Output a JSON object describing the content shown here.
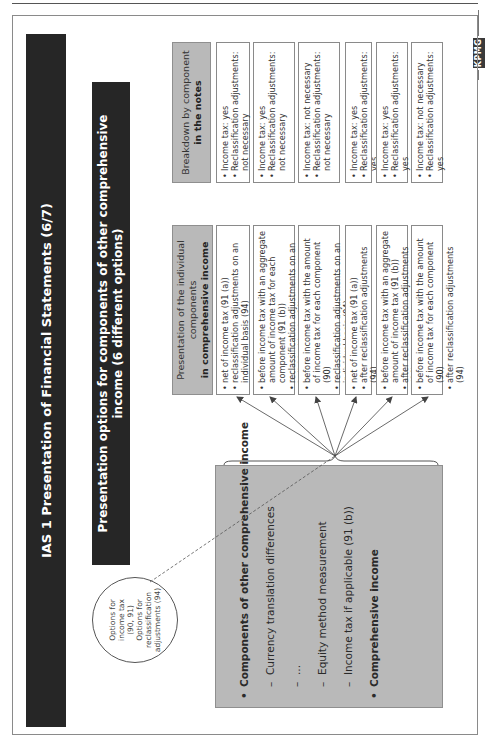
{
  "page": {
    "logo": "KPMG"
  },
  "header": {
    "title": "IAS 1 Presentation of Financial Statements (6/7)",
    "subtitle": "Presentation options for components of other comprehensive income (6 different options)"
  },
  "callout": {
    "lines": [
      "Options for",
      "income tax",
      "(90, 91)",
      "Options for",
      "reclassification",
      "adjustments (94)"
    ]
  },
  "components_box": {
    "heading": "Components of other comprehensive income",
    "items": [
      "Currency translation differences",
      "...",
      "Equity method measurement",
      "Income tax if applicable (91 (b))"
    ],
    "total": "Comprehensive income"
  },
  "columns": {
    "presentation": {
      "line1": "Presentation of the individual",
      "line2": "components",
      "line3": "in comprehensive income"
    },
    "notes": {
      "line1": "Breakdown by component",
      "line2": "in the notes"
    }
  },
  "options": [
    {
      "presentation": [
        "net of income tax (91 (a))",
        "reclassification adjustments on an individual basis (94)"
      ],
      "notes": [
        "Income tax: yes",
        "Reclassification adjustments: not necessary"
      ]
    },
    {
      "presentation": [
        "before income tax with an aggregate amount of income tax for each component (91 (b))",
        "reclassification adjustments on an individual basis (94)"
      ],
      "notes": [
        "Income tax: yes",
        "Reclassification adjustments: not necessary"
      ]
    },
    {
      "presentation": [
        "before income tax with the amount of income tax for each component (90)",
        "reclassification adjustments on an individual basis (94)"
      ],
      "notes": [
        "Income tax: not necessary",
        "Reclassification adjustments: not necessary"
      ]
    },
    {
      "presentation": [
        "net of income tax (91 (a))",
        "after reclassification adjustments (94)"
      ],
      "notes": [
        "Income tax: yes",
        "Reclassification adjustments: yes"
      ]
    },
    {
      "presentation": [
        "before income tax with an aggregate amount of income tax (91 (b))",
        "after reclassification adjustments (94)"
      ],
      "notes": [
        "Income tax: yes",
        "Reclassification adjustments: yes"
      ]
    },
    {
      "presentation": [
        "before income tax with the amount of income tax for each component (90)",
        "after reclassification adjustments (94)"
      ],
      "notes": [
        "Income tax: not necessary",
        "Reclassification adjustments: yes"
      ]
    }
  ],
  "colors": {
    "dark_bar": "#262626",
    "grey_fill": "#b9b9b9",
    "border": "#8a8a8a"
  }
}
